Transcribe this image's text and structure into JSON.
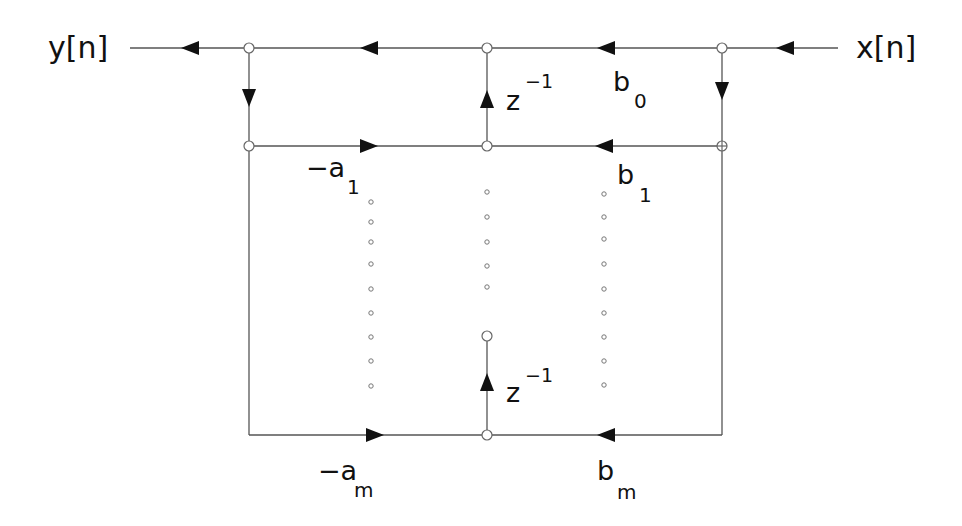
{
  "diagram": {
    "colors": {
      "line": "#555555",
      "arrow": "#111111",
      "node_stroke": "#666666",
      "text": "#111111",
      "background": "#ffffff"
    },
    "io": {
      "output": {
        "base": "y",
        "bracket": "[n]"
      },
      "input": {
        "base": "x",
        "bracket": "[n]"
      }
    },
    "coefficients": {
      "b0": {
        "base": "b",
        "sub": "0"
      },
      "b1": {
        "base": "b",
        "sub": "1"
      },
      "bm": {
        "base": "b",
        "sub": "m"
      },
      "a1": {
        "base": "−a",
        "sub": "1"
      },
      "am": {
        "base": "−a",
        "sub": "m"
      }
    },
    "delays": [
      {
        "base": "z",
        "sup": "−1"
      },
      {
        "base": "z",
        "sup": "−1"
      }
    ],
    "ellipsis_columns": [
      {
        "name": "feedback-a",
        "x": 370,
        "count": 9
      },
      {
        "name": "delay-chain",
        "x": 487,
        "count": 5
      },
      {
        "name": "feedforward-b",
        "x": 603,
        "count": 9
      }
    ]
  }
}
